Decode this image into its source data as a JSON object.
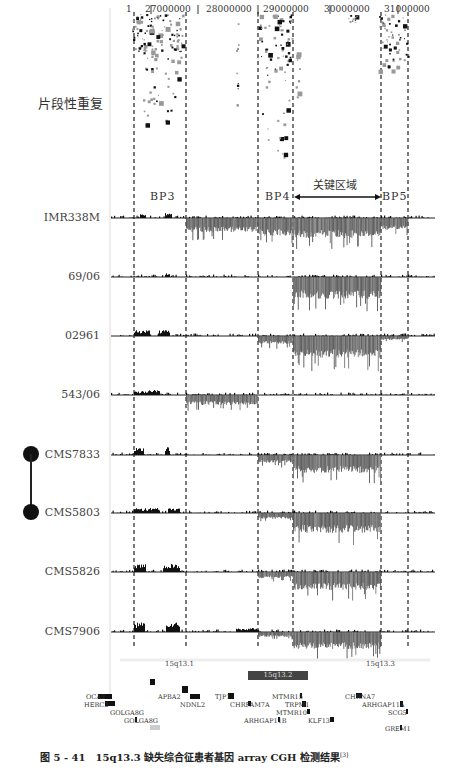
{
  "figure": {
    "caption": "图 5 - 41　15q13.3 缺失综合征患者基因 array CGH 检测结果",
    "caption_ref": "[3]",
    "segmental_dup_label": "片段性重复",
    "region_label": "关键区域",
    "breakpoints": [
      {
        "label": "BP3"
      },
      {
        "label": "BP4"
      },
      {
        "label": "BP5"
      }
    ],
    "axis_ticks": [
      "1",
      "27000000",
      "28000000",
      "29000000",
      "30000000",
      "31000000"
    ],
    "samples": [
      {
        "name": "IMR338M"
      },
      {
        "name": "69/06"
      },
      {
        "name": "02961"
      },
      {
        "name": "543/06"
      },
      {
        "name": "CMS7833"
      },
      {
        "name": "CMS5803"
      },
      {
        "name": "CMS5826"
      },
      {
        "name": "CMS7906"
      }
    ],
    "family_link": [
      "CMS7833",
      "CMS5803"
    ],
    "bands": [
      {
        "label": "15q13.1"
      },
      {
        "label": "15q13.2"
      },
      {
        "label": "15q13.3"
      }
    ],
    "genes": [
      {
        "label": "OCA2"
      },
      {
        "label": "HERC2"
      },
      {
        "label": "GOLGA8G"
      },
      {
        "label": "GOLGA8G"
      },
      {
        "label": "APBA2"
      },
      {
        "label": "NDNL2"
      },
      {
        "label": "TJP1"
      },
      {
        "label": "CHRFAM7A"
      },
      {
        "label": "ARHGAP11B"
      },
      {
        "label": "MTMR15"
      },
      {
        "label": "TRPM1"
      },
      {
        "label": "MTMR10"
      },
      {
        "label": "KLF13"
      },
      {
        "label": "CHRNA7"
      },
      {
        "label": "ARHGAP11A"
      },
      {
        "label": "SCG5"
      },
      {
        "label": "GREM1"
      }
    ],
    "colors": {
      "deletion": "#555555",
      "gain": "#111111",
      "dashed_line": "#222222",
      "band_q13_2": "#444444"
    }
  },
  "chart_data": {
    "type": "array-CGH profile",
    "title": "15q13.3 缺失综合征患者基因 array CGH 检测结果",
    "xlabel": "Chromosome 15 position (bp)",
    "x_ticks": [
      27000000,
      28000000,
      29000000,
      30000000,
      31000000
    ],
    "breakpoints": [
      "BP3",
      "BP4",
      "BP5"
    ],
    "critical_region": "关键区域 (BP4–BP5)",
    "series": [
      {
        "name": "IMR338M",
        "deletion": "BP3–BP5 (largest)"
      },
      {
        "name": "69/06",
        "deletion": "BP4–BP5"
      },
      {
        "name": "02961",
        "deletion": "BP4–BP5"
      },
      {
        "name": "543/06",
        "deletion": "BP3–BP4 region"
      },
      {
        "name": "CMS7833",
        "deletion": "BP4–BP5"
      },
      {
        "name": "CMS5803",
        "deletion": "BP4–BP5"
      },
      {
        "name": "CMS5826",
        "deletion": "BP4–BP5"
      },
      {
        "name": "CMS7906",
        "deletion": "BP4–BP5"
      }
    ],
    "bands": [
      "15q13.1",
      "15q13.2",
      "15q13.3"
    ]
  }
}
